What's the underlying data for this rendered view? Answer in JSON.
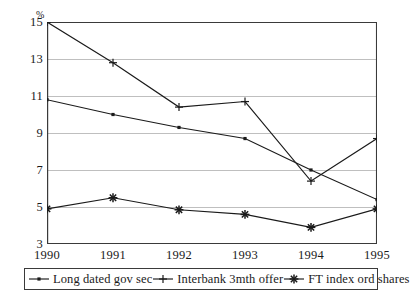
{
  "chart_data": {
    "type": "line",
    "title": "",
    "subtitle": "",
    "xlabel": "",
    "ylabel": "%",
    "unit_label": "%",
    "categories": [
      "1990",
      "1991",
      "1992",
      "1993",
      "1994",
      "1995"
    ],
    "x": [
      1990,
      1991,
      1992,
      1993,
      1994,
      1995
    ],
    "xlim": [
      1990,
      1995
    ],
    "ylim": [
      3,
      15
    ],
    "yticks": [
      3,
      5,
      7,
      9,
      11,
      13,
      15
    ],
    "ytick_labels": [
      "3",
      "5",
      "7",
      "9",
      "11",
      "13",
      "15"
    ],
    "xtick_labels": [
      "1990",
      "1991",
      "1992",
      "1993",
      "1994",
      "1995"
    ],
    "grid": true,
    "grid_axis": "y",
    "grid_color": "#bfbfbf",
    "axis_color": "#3a3a3a",
    "line_color": "#1a1a1a",
    "legend_position": "below",
    "series": [
      {
        "name": "Long dated gov sec",
        "marker": "dot",
        "values": [
          10.8,
          10.0,
          9.3,
          8.7,
          7.0,
          5.4
        ]
      },
      {
        "name": "Interbank 3mth offer",
        "marker": "plus",
        "values": [
          15.0,
          12.8,
          10.4,
          10.7,
          6.4,
          8.7
        ]
      },
      {
        "name": "FT index ord shares",
        "marker": "asterisk",
        "values": [
          4.9,
          5.5,
          4.85,
          4.6,
          3.9,
          4.9
        ]
      }
    ]
  },
  "legend": {
    "entries": [
      {
        "label": "Long dated gov sec",
        "marker": "dot"
      },
      {
        "label": "Interbank 3mth offer",
        "marker": "plus"
      },
      {
        "label": "FT index ord shares",
        "marker": "asterisk"
      }
    ]
  }
}
